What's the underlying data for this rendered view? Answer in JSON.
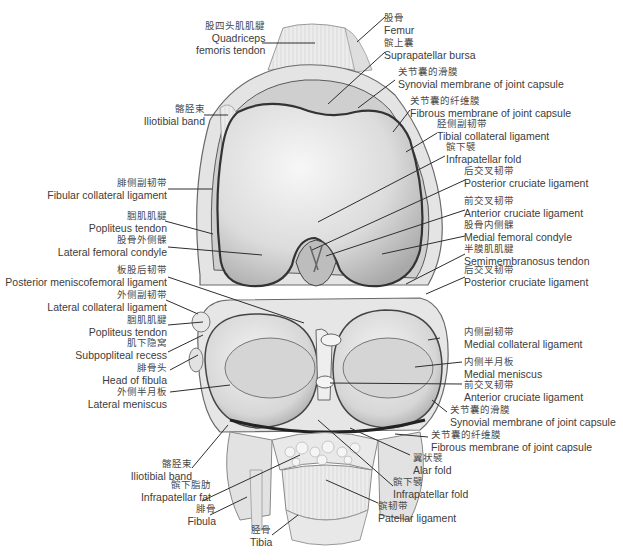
{
  "diagram": {
    "colors": {
      "background": "#ffffff",
      "tissue_light": "#efefef",
      "tissue_mid": "#d2d2d2",
      "tissue_dark": "#5a5a5a",
      "outline": "#3a3a3a",
      "leader_line": "#2e2e2e",
      "text": "#3c3c3c"
    },
    "labels": {
      "quadriceps_tendon": {
        "zh": "股四头肌肌腱",
        "en1": "Quadriceps",
        "en2": "femoris tendon"
      },
      "femur": {
        "zh": "股骨",
        "en": "Femur"
      },
      "suprapatellar_bursa": {
        "zh": "髌上囊",
        "en": "Suprapatellar bursa"
      },
      "synovial_membrane_top": {
        "zh": "关节囊的滑膜",
        "en": "Synovial membrane of joint capsule"
      },
      "fibrous_membrane_top": {
        "zh": "关节囊的纤维膜",
        "en": "Fibrous membrane of joint capsule"
      },
      "tibial_collateral": {
        "zh": "胫侧副韧带",
        "en": "Tibial collateral ligament"
      },
      "infrapatellar_fold_top": {
        "zh": "髌下襞",
        "en": "Infrapatellar fold"
      },
      "pcl_top": {
        "zh": "后交叉韧带",
        "en": "Posterior cruciate ligament"
      },
      "acl_top": {
        "zh": "前交叉韧带",
        "en": "Anterior cruciate ligament"
      },
      "medial_femoral_condyle": {
        "zh": "股骨内侧髁",
        "en": "Medial femoral condyle"
      },
      "semimembranosus": {
        "zh": "半膜肌肌腱",
        "en": "Semimembranosus tendon"
      },
      "pcl_mid": {
        "zh": "后交叉韧带",
        "en": "Posterior cruciate ligament"
      },
      "iliotibial_top": {
        "zh": "髂胫束",
        "en": "Iliotibial band"
      },
      "fibular_collateral": {
        "zh": "腓侧副韧带",
        "en": "Fibular collateral ligament"
      },
      "popliteus_top": {
        "zh": "腘肌肌腱",
        "en": "Popliteus tendon"
      },
      "lateral_femoral_condyle": {
        "zh": "股骨外侧髁",
        "en": "Lateral femoral condyle"
      },
      "posterior_meniscofemoral": {
        "zh": "板股后韧带",
        "en": "Posterior meniscofemoral ligament"
      },
      "lateral_collateral": {
        "zh": "外侧副韧带",
        "en": "Lateral collateral ligament"
      },
      "popliteus_bottom": {
        "zh": "腘肌肌腱",
        "en": "Popliteus tendon"
      },
      "subpopliteal_recess": {
        "zh": "肌下隐窝",
        "en": "Subpopliteal recess"
      },
      "head_of_fibula": {
        "zh": "腓骨头",
        "en": "Head of fibula"
      },
      "lateral_meniscus": {
        "zh": "外侧半月板",
        "en": "Lateral meniscus"
      },
      "medial_collateral": {
        "zh": "内侧副韧带",
        "en": "Medial collateral ligament"
      },
      "medial_meniscus": {
        "zh": "内侧半月板",
        "en": "Medial meniscus"
      },
      "acl_bottom": {
        "zh": "前交叉韧带",
        "en": "Anterior cruciate ligament"
      },
      "synovial_membrane_bottom": {
        "zh": "关节囊的滑膜",
        "en": "Synovial membrane of joint capsule"
      },
      "fibrous_membrane_bottom": {
        "zh": "关节囊的纤维膜",
        "en": "Fibrous membrane of joint capsule"
      },
      "alar_fold": {
        "zh": "翼状襞",
        "en": "Alar fold"
      },
      "infrapatellar_fold_bottom": {
        "zh": "髌下襞",
        "en": "Infrapatellar fold"
      },
      "patellar_ligament": {
        "zh": "髌韧带",
        "en": "Patellar ligament"
      },
      "iliotibial_bottom": {
        "zh": "髂胫束",
        "en": "Iliotibial band"
      },
      "infrapatellar_fat": {
        "zh": "髌下脂肪",
        "en": "Infrapatellar fat"
      },
      "fibula": {
        "zh": "腓骨",
        "en": "Fibula"
      },
      "tibia": {
        "zh": "胫骨",
        "en": "Tibia"
      }
    }
  }
}
